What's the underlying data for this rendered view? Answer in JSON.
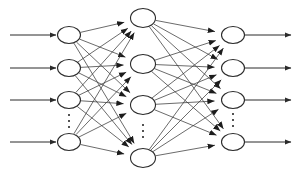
{
  "diagram": {
    "type": "neural-network",
    "background_color": "#ffffff",
    "stroke_color": "#2b2b2b",
    "edge_color": "#3a3a3a",
    "node_fill": "#ffffff",
    "ellipsis_glyph": "⋮",
    "layers": [
      {
        "name": "input-layer",
        "label": "",
        "x": 69,
        "node_rx": 11.5,
        "node_ry": 8.5,
        "nodes": [
          {
            "id": "i1",
            "cy": 35,
            "label": ""
          },
          {
            "id": "i2",
            "cy": 68,
            "label": ""
          },
          {
            "id": "i3",
            "cy": 100,
            "label": ""
          },
          {
            "id": "i4",
            "cy": 142,
            "label": ""
          }
        ],
        "ellipsis": {
          "x": 69,
          "y": 121
        }
      },
      {
        "name": "hidden-layer",
        "label": "",
        "x": 143,
        "node_rx": 12.5,
        "node_ry": 9.5,
        "nodes": [
          {
            "id": "h1",
            "cy": 18,
            "label": ""
          },
          {
            "id": "h2",
            "cy": 64,
            "label": ""
          },
          {
            "id": "h3",
            "cy": 105,
            "label": ""
          },
          {
            "id": "h4",
            "cy": 158,
            "label": ""
          }
        ],
        "ellipsis": {
          "x": 143,
          "y": 131
        }
      },
      {
        "name": "output-layer",
        "label": "",
        "x": 233,
        "node_rx": 11.5,
        "node_ry": 8.5,
        "nodes": [
          {
            "id": "o1",
            "cy": 35,
            "label": ""
          },
          {
            "id": "o2",
            "cy": 68,
            "label": ""
          },
          {
            "id": "o3",
            "cy": 100,
            "label": ""
          },
          {
            "id": "o4",
            "cy": 142,
            "label": ""
          }
        ],
        "ellipsis": {
          "x": 233,
          "y": 120
        }
      }
    ],
    "input_arrows": [
      {
        "id": "in1",
        "x1": 10,
        "x2": 56,
        "y": 35
      },
      {
        "id": "in2",
        "x1": 10,
        "x2": 56,
        "y": 68
      },
      {
        "id": "in3",
        "x1": 10,
        "x2": 56,
        "y": 100
      },
      {
        "id": "in4",
        "x1": 10,
        "x2": 56,
        "y": 142
      }
    ],
    "output_arrows": [
      {
        "id": "out1",
        "x1": 245,
        "x2": 291,
        "y": 35
      },
      {
        "id": "out2",
        "x1": 245,
        "x2": 291,
        "y": 68
      },
      {
        "id": "out3",
        "x1": 245,
        "x2": 291,
        "y": 100
      },
      {
        "id": "out4",
        "x1": 245,
        "x2": 291,
        "y": 142
      }
    ],
    "connections_input_hidden": [
      {
        "from": "i1",
        "to": "h1"
      },
      {
        "from": "i1",
        "to": "h2"
      },
      {
        "from": "i1",
        "to": "h3"
      },
      {
        "from": "i1",
        "to": "h4"
      },
      {
        "from": "i2",
        "to": "h1"
      },
      {
        "from": "i2",
        "to": "h2"
      },
      {
        "from": "i2",
        "to": "h3"
      },
      {
        "from": "i2",
        "to": "h4"
      },
      {
        "from": "i3",
        "to": "h1"
      },
      {
        "from": "i3",
        "to": "h2"
      },
      {
        "from": "i3",
        "to": "h3"
      },
      {
        "from": "i3",
        "to": "h4"
      },
      {
        "from": "i4",
        "to": "h1"
      },
      {
        "from": "i4",
        "to": "h2"
      },
      {
        "from": "i4",
        "to": "h3"
      },
      {
        "from": "i4",
        "to": "h4"
      }
    ],
    "connections_hidden_output": [
      {
        "from": "h1",
        "to": "o1"
      },
      {
        "from": "h1",
        "to": "o2"
      },
      {
        "from": "h1",
        "to": "o3"
      },
      {
        "from": "h1",
        "to": "o4"
      },
      {
        "from": "h2",
        "to": "o1"
      },
      {
        "from": "h2",
        "to": "o2"
      },
      {
        "from": "h2",
        "to": "o3"
      },
      {
        "from": "h2",
        "to": "o4"
      },
      {
        "from": "h3",
        "to": "o1"
      },
      {
        "from": "h3",
        "to": "o2"
      },
      {
        "from": "h3",
        "to": "o3"
      },
      {
        "from": "h3",
        "to": "o4"
      },
      {
        "from": "h4",
        "to": "o1"
      },
      {
        "from": "h4",
        "to": "o2"
      },
      {
        "from": "h4",
        "to": "o3"
      },
      {
        "from": "h4",
        "to": "o4"
      }
    ]
  }
}
